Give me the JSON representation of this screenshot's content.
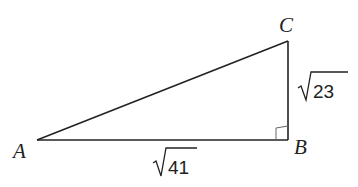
{
  "diagram": {
    "type": "right-triangle",
    "vertices": {
      "A": {
        "label": "A"
      },
      "B": {
        "label": "B"
      },
      "C": {
        "label": "C"
      }
    },
    "right_angle_at": "B",
    "sides": {
      "AB": {
        "label": "41",
        "radical": "√"
      },
      "BC": {
        "label": "23",
        "radical": "√"
      }
    },
    "colors": {
      "stroke": "#222222",
      "background": "#ffffff"
    }
  }
}
